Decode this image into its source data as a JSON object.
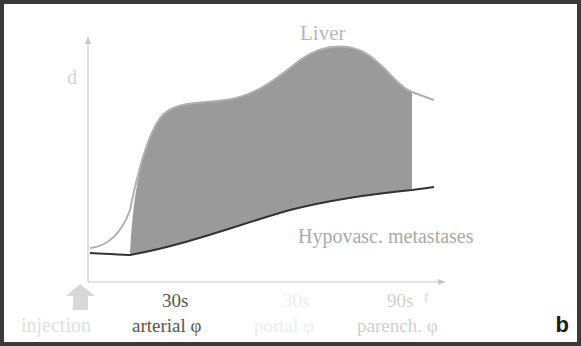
{
  "diagram": {
    "panel_label": "b",
    "y_axis_label": "d",
    "x_axis_label": "t",
    "curves": {
      "liver": {
        "label": "Liver",
        "color": "#b0b0b0"
      },
      "metastases": {
        "label": "Hypovasc. metastases",
        "color": "#333333"
      }
    },
    "fill_color": "#999999",
    "time_marks": [
      {
        "time": "30s",
        "phase": "arterial φ",
        "emphasis": "dark"
      },
      {
        "time": "30s",
        "phase": "portal φ",
        "emphasis": "faint"
      },
      {
        "time": "90s",
        "phase": "parench. φ",
        "emphasis": "light"
      }
    ],
    "injection": {
      "label": "injection",
      "icon": "up-arrow-icon"
    }
  },
  "colors": {
    "frame": "#3a3a3a",
    "axis": "#c8c8c8",
    "text_light": "#b8b8b8",
    "text_faint": "#e4e4e4",
    "text_dark": "#333333"
  }
}
